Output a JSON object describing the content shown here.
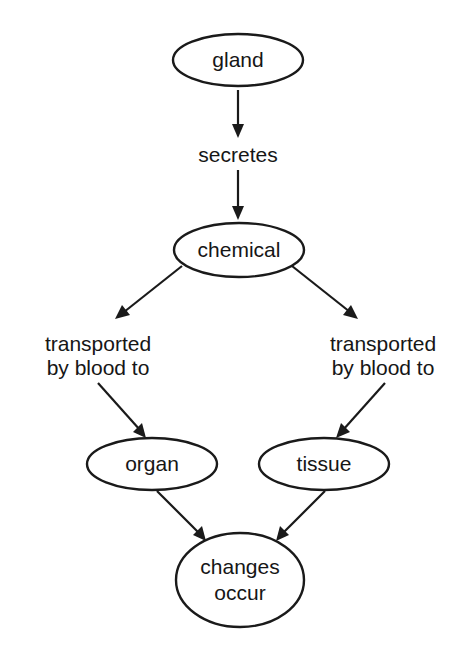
{
  "diagram": {
    "type": "flowchart",
    "nodes": {
      "gland": {
        "label": "gland"
      },
      "chemical": {
        "label": "chemical"
      },
      "organ": {
        "label": "organ"
      },
      "tissue": {
        "label": "tissue"
      },
      "changes": {
        "line1": "changes",
        "line2": "occur"
      }
    },
    "edge_labels": {
      "secretes": "secretes",
      "left_line1": "transported",
      "left_line2": "by blood to",
      "right_line1": "transported",
      "right_line2": "by blood to"
    },
    "edges": [
      {
        "from": "gland",
        "to": "chemical",
        "label": "secretes"
      },
      {
        "from": "chemical",
        "to": "organ",
        "label": "transported by blood to"
      },
      {
        "from": "chemical",
        "to": "tissue",
        "label": "transported by blood to"
      },
      {
        "from": "organ",
        "to": "changes occur",
        "label": ""
      },
      {
        "from": "tissue",
        "to": "changes occur",
        "label": ""
      }
    ]
  }
}
